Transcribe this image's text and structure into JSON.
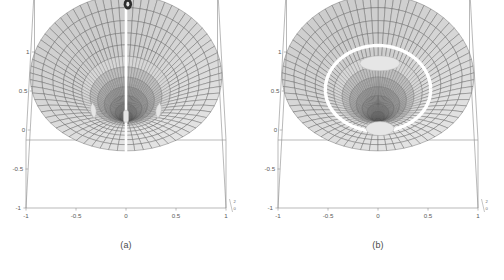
{
  "figure": {
    "background": "#ffffff",
    "panel_count": 2
  },
  "style": {
    "cell_fill": "#d8d8d8",
    "cell_fill_light": "#e6e6e6",
    "cell_fill_dark": "#9a9a9a",
    "mesh_line": "#555555",
    "frame_line": "#8a8a8a",
    "seam_color": "#ffffff",
    "tick_color": "#5a5a5a",
    "caption_color": "#4a4a4a"
  },
  "panels": [
    {
      "id": "a",
      "caption": "(a)",
      "top_marker_label": "0",
      "axes": {
        "x_ticks": [
          "-1",
          "-0.5",
          "0",
          "0.5",
          "1"
        ],
        "x_values": [
          -1,
          -0.5,
          0,
          0.5,
          1
        ],
        "y_ticks": [
          "1",
          "0.5",
          "0",
          "-0.5",
          "-1"
        ],
        "y_values": [
          1,
          0.5,
          0,
          -0.5,
          -1
        ],
        "z_ticks": [
          "2",
          "0"
        ],
        "z_values": [
          2,
          0
        ],
        "xlim": [
          -1,
          1
        ],
        "ylim": [
          -1,
          1
        ],
        "zlim": [
          0,
          2
        ]
      },
      "features": {
        "seam": "vertical white seam through center",
        "center": "dark funnel / crater depression",
        "patches": [
          "left crescent",
          "right crescent",
          "center sliver"
        ],
        "ring": "none"
      }
    },
    {
      "id": "b",
      "caption": "(b)",
      "top_marker_label": "",
      "axes": {
        "x_ticks": [
          "-1",
          "-0.5",
          "0",
          "0.5",
          "1"
        ],
        "x_values": [
          -1,
          -0.5,
          0,
          0.5,
          1
        ],
        "y_ticks": [
          "1",
          "0.5",
          "0",
          "-0.5",
          "-1"
        ],
        "y_values": [
          1,
          0.5,
          0,
          -0.5,
          -1
        ],
        "z_ticks": [
          "2",
          "0"
        ],
        "z_values": [
          2,
          0
        ],
        "xlim": [
          -1,
          1
        ],
        "ylim": [
          -1,
          1
        ],
        "zlim": [
          0,
          2
        ]
      },
      "features": {
        "seam": "none",
        "center": "dark inner funnel",
        "patches": [
          "upper ellipse",
          "lower ellipse"
        ],
        "ring": "white annular ring separating outer and inner mesh"
      }
    }
  ],
  "chart_data": {
    "type": "surface",
    "title": "",
    "subtitle": "",
    "panel_labels": [
      "(a)",
      "(b)"
    ],
    "xlabel": "",
    "ylabel": "",
    "zlabel": "",
    "xlim": [
      -1,
      1
    ],
    "ylim": [
      -1,
      1
    ],
    "zlim": [
      0,
      2
    ],
    "x_tick_labels": [
      "-1",
      "-0.5",
      "0",
      "0.5",
      "1"
    ],
    "y_tick_labels": [
      "-1",
      "-0.5",
      "0",
      "0.5",
      "1"
    ],
    "z_tick_labels": [
      "0",
      "2"
    ],
    "grid": true,
    "legend": false,
    "projection": "3d-perspective",
    "mesh": "polar (radial x angular) quadrilateral grid over unit disc",
    "series": [
      {
        "name": "(a) surface",
        "domain": "unit disc r<=1",
        "description": "Radially symmetric surface rising to a rim near r=1 and plunging into a deep dark funnel at the origin; a white meridian seam runs top-to-bottom through theta=0; two pale crescent patches sit left and right of the center at about y=-0.15.",
        "radial_divisions": 14,
        "angular_divisions": 36,
        "rim_height": 0.85,
        "center_height": 0.0
      },
      {
        "name": "(b) surface",
        "domain": "unit disc r<=1",
        "description": "Outer coarse polar mesh annulus separated by a bright white ring at about r=0.55 from a dense dark inner funnel; two pale elliptical patches appear above and below the inner funnel.",
        "radial_divisions": 14,
        "angular_divisions": 36,
        "ring_radius": 0.55,
        "rim_height": 0.85,
        "center_height": 0.0
      }
    ]
  }
}
